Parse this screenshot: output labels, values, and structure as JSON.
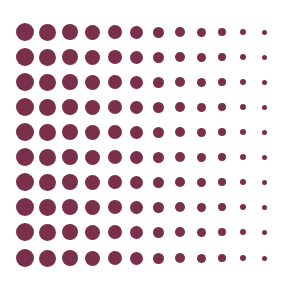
{
  "pattern": {
    "type": "halftone-dot-grid",
    "rows": 10,
    "cols": 12,
    "dot_color": "#7a2f4a",
    "background": "#ffffff",
    "row_centers_y": [
      32,
      57,
      82,
      107,
      132,
      157,
      182,
      207,
      232,
      258
    ],
    "col_centers_x": [
      25,
      47,
      70,
      92,
      115,
      136,
      158,
      180,
      201,
      222,
      243,
      264
    ],
    "col_diameters": [
      18,
      17,
      16,
      15,
      14,
      13,
      11,
      10,
      9,
      8,
      6,
      5
    ]
  }
}
